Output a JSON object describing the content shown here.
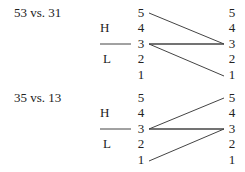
{
  "diagrams": [
    {
      "title": "53 vs. 31",
      "register_labels": {
        "high": "H",
        "low": "L"
      },
      "left_scale": [
        "5",
        "4",
        "3",
        "2",
        "1"
      ],
      "right_scale": [
        "5",
        "4",
        "3",
        "2",
        "1"
      ],
      "contours": [
        {
          "from": "5",
          "to": "3"
        },
        {
          "from": "3",
          "to": "3"
        },
        {
          "from": "3",
          "to": "1"
        }
      ]
    },
    {
      "title": "35 vs. 13",
      "register_labels": {
        "high": "H",
        "low": "L"
      },
      "left_scale": [
        "5",
        "4",
        "3",
        "2",
        "1"
      ],
      "right_scale": [
        "5",
        "4",
        "3",
        "2",
        "1"
      ],
      "contours": [
        {
          "from": "3",
          "to": "5"
        },
        {
          "from": "3",
          "to": "3"
        },
        {
          "from": "1",
          "to": "3"
        }
      ]
    }
  ],
  "colors": {
    "text": "#222222",
    "line": "#444444"
  }
}
